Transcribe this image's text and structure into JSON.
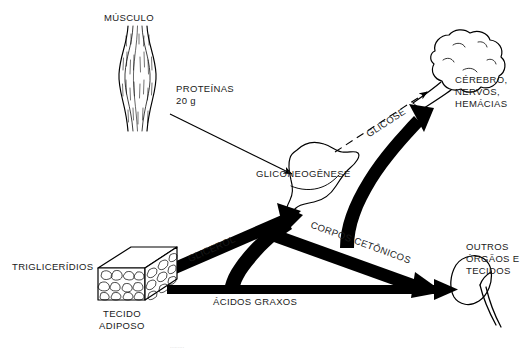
{
  "figure": {
    "background_color": "#ffffff",
    "stroke_color": "#000000",
    "caption_partial": "........."
  },
  "nodes": {
    "muscle": {
      "label": "MÚSCULO",
      "icon": "muscle-icon",
      "output_label": "PROTEÍNAS",
      "output_amount": "20 g"
    },
    "liver": {
      "label": "GLICONEOGÊNESE",
      "icon": "liver-icon"
    },
    "adipose": {
      "label_left": "TRIGLICERÍDIOS",
      "label_bottom_line1": "TECIDO",
      "label_bottom_line2": "ADIPOSO",
      "icon": "adipose-tissue-block-icon"
    },
    "brain": {
      "line1": "CÉREBRO,",
      "line2": "NERVOS,",
      "line3": "HEMÁCIAS",
      "icon": "brain-icon"
    },
    "other_tissues": {
      "line1": "OUTROS",
      "line2": "ÓRGÃOS E",
      "line3": "TECIDOS",
      "icon": "kidney-icon"
    }
  },
  "arrows": [
    {
      "name": "proteins-to-liver",
      "label": "",
      "style": "thin-solid",
      "from": "muscle",
      "to": "liver"
    },
    {
      "name": "glycerol-to-liver",
      "label": "GLICEROL",
      "style": "thick-solid",
      "from": "adipose",
      "to": "liver"
    },
    {
      "name": "fatty-acids-to-tissues",
      "label": "ÁCIDOS GRAXOS",
      "style": "thick-solid",
      "from": "adipose",
      "to": "other_tissues"
    },
    {
      "name": "fatty-acids-to-liver",
      "label": "",
      "style": "thick-solid-curved",
      "from": "adipose",
      "to": "liver"
    },
    {
      "name": "glucose-to-brain",
      "label": "GLICOSE",
      "style": "dashed",
      "from": "liver",
      "to": "brain"
    },
    {
      "name": "ketone-bodies-to-brain",
      "label": "CORPOS CETÔNICOS",
      "style": "thick-solid-curved",
      "from": "liver",
      "to": "brain"
    },
    {
      "name": "ketone-bodies-to-tissues",
      "label": "CORPOS CETÔNICOS",
      "style": "thick-solid",
      "from": "liver",
      "to": "other_tissues"
    }
  ]
}
